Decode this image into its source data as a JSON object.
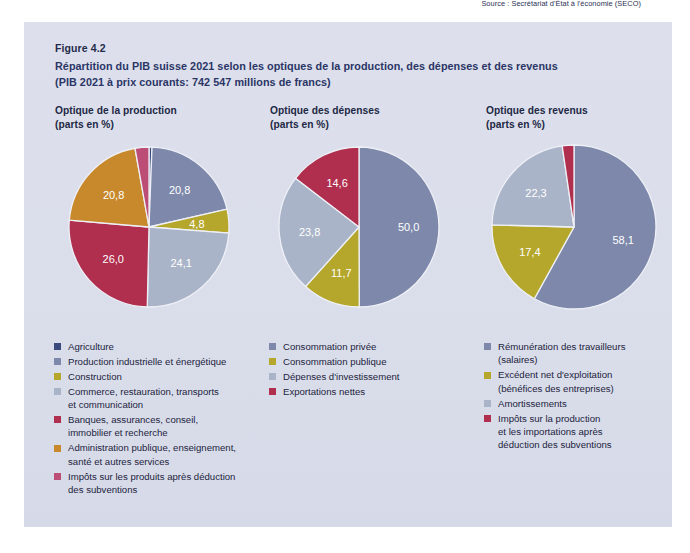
{
  "figure": {
    "number": "Figure 4.2",
    "title": "Répartition du PIB suisse 2021 selon les optiques de la production, des dépenses et des revenus",
    "subtitle": "(PIB 2021 à prix courants: 742 547 millions de francs)",
    "source": "Source : Secrétariat d'État à l'économie (SECO)"
  },
  "colors": {
    "navy": "#3b4a7e",
    "slate_blue": "#7d88ab",
    "olive": "#b5a72c",
    "light_blue_grey": "#aab4c8",
    "crimson": "#b02e4e",
    "orange_brown": "#c8882c",
    "magenta": "#bc4d74",
    "panel_bg": "#dadeea",
    "text": "#1d2340"
  },
  "chart_data": [
    {
      "type": "pie",
      "title": "Optique de la production",
      "units": "(parts en %)",
      "categories": [
        "Agriculture",
        "Production industrielle et énergétique",
        "Construction",
        "Commerce, restauration, transports et communication",
        "Banques, assurances, conseil, immobilier et recherche",
        "Administration publique, enseignement, santé et autres services",
        "Impôts sur les produits après déduction des subventions"
      ],
      "values": [
        0.6,
        20.8,
        4.8,
        24.1,
        26.0,
        20.8,
        2.8
      ],
      "labels": [
        "0,6",
        "20,8",
        "4,8",
        "24,1",
        "26,0",
        "20,8",
        "2,8"
      ],
      "colors": [
        "#3b4a7e",
        "#7d88ab",
        "#b5a72c",
        "#aab4c8",
        "#b02e4e",
        "#c8882c",
        "#bc4d74"
      ],
      "legend": [
        {
          "label": "Agriculture",
          "color": "#3b4a7e"
        },
        {
          "label": "Production industrielle et énergétique",
          "color": "#7d88ab"
        },
        {
          "label": "Construction",
          "color": "#b5a72c"
        },
        {
          "label": "Commerce, restauration, transports et communication",
          "color": "#aab4c8"
        },
        {
          "label": "Banques, assurances, conseil, immobilier et recherche",
          "color": "#b02e4e"
        },
        {
          "label": "Administration publique, enseignement, santé et autres services",
          "color": "#c8882c"
        },
        {
          "label": "Impôts sur les produits après déduction des subventions",
          "color": "#bc4d74"
        }
      ]
    },
    {
      "type": "pie",
      "title": "Optique des dépenses",
      "units": "(parts en %)",
      "categories": [
        "Consommation privée",
        "Consommation publique",
        "Dépenses d'investissement",
        "Exportations nettes"
      ],
      "values": [
        50.0,
        11.7,
        23.8,
        14.6
      ],
      "labels": [
        "50,0",
        "11,7",
        "23,8",
        "14,6"
      ],
      "colors": [
        "#7d88ab",
        "#b5a72c",
        "#aab4c8",
        "#b02e4e"
      ],
      "legend": [
        {
          "label": "Consommation privée",
          "color": "#7d88ab"
        },
        {
          "label": "Consommation publique",
          "color": "#b5a72c"
        },
        {
          "label": "Dépenses d'investissement",
          "color": "#aab4c8"
        },
        {
          "label": "Exportations nettes",
          "color": "#b02e4e"
        }
      ]
    },
    {
      "type": "pie",
      "title": "Optique des revenus",
      "units": "(parts en %)",
      "categories": [
        "Rémunération des travailleurs (salaires)",
        "Excédent net d'exploitation (bénéfices des entreprises)",
        "Amortissements",
        "Impôts sur la production et les importations après déduction des subventions"
      ],
      "values": [
        58.1,
        17.4,
        22.3,
        2.3
      ],
      "labels": [
        "58,1",
        "17,4",
        "22,3",
        "2,3"
      ],
      "colors": [
        "#7d88ab",
        "#b5a72c",
        "#aab4c8",
        "#b02e4e"
      ],
      "legend": [
        {
          "label": "Rémunération des travailleurs (salaires)",
          "color": "#7d88ab"
        },
        {
          "label": "Excédent net d'exploitation (bénéfices des entreprises)",
          "color": "#b5a72c"
        },
        {
          "label": "Amortissements",
          "color": "#aab4c8"
        },
        {
          "label": "Impôts sur la production et les importations après déduction des subventions",
          "color": "#b02e4e"
        }
      ]
    }
  ],
  "legend_lines": {
    "chart1": [
      [
        "Agriculture"
      ],
      [
        "Production industrielle et énergétique"
      ],
      [
        "Construction"
      ],
      [
        "Commerce, restauration, transports",
        "et communication"
      ],
      [
        "Banques, assurances, conseil,",
        "immobilier et recherche"
      ],
      [
        "Administration publique, enseignement,",
        "santé et autres services"
      ],
      [
        "Impôts sur les produits après déduction",
        "des subventions"
      ]
    ],
    "chart2": [
      [
        "Consommation privée"
      ],
      [
        "Consommation publique"
      ],
      [
        "Dépenses d'investissement"
      ],
      [
        "Exportations nettes"
      ]
    ],
    "chart3": [
      [
        "Rémunération des travailleurs",
        "(salaires)"
      ],
      [
        "Excédent net d'exploitation",
        "(bénéfices des entreprises)"
      ],
      [
        "Amortissements"
      ],
      [
        "Impôts sur la production",
        "et les importations après",
        "déduction des subventions"
      ]
    ]
  }
}
